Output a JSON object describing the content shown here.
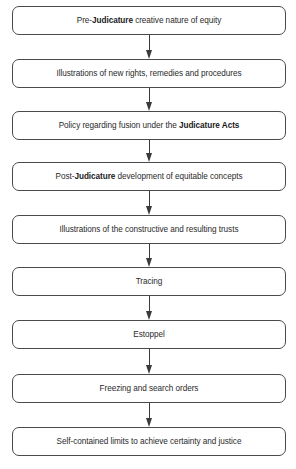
{
  "diagram": {
    "type": "vertical-flowchart",
    "colors": {
      "background": "#ffffff",
      "border": "#4a4a4a",
      "text": "#2a2a2a",
      "arrow": "#3a3a3a"
    },
    "nodes": [
      {
        "id": "n1",
        "top": 6,
        "pre": "Pre-",
        "bold": "Judicature",
        "post": " creative nature of equity"
      },
      {
        "id": "n2",
        "top": 59,
        "pre": "Illustrations of new rights, remedies and procedures",
        "bold": "",
        "post": ""
      },
      {
        "id": "n3",
        "top": 111,
        "pre": "Policy regarding fusion under the ",
        "bold": "Judicature Acts",
        "post": ""
      },
      {
        "id": "n4",
        "top": 162,
        "pre": "Post-",
        "bold": "Judicature",
        "post": " development of equitable concepts"
      },
      {
        "id": "n5",
        "top": 215,
        "pre": "Illustrations of the constructive and resulting  trusts",
        "bold": "",
        "post": ""
      },
      {
        "id": "n6",
        "top": 267,
        "pre": "Tracing",
        "bold": "",
        "post": ""
      },
      {
        "id": "n7",
        "top": 320,
        "pre": "Estoppel",
        "bold": "",
        "post": ""
      },
      {
        "id": "n8",
        "top": 374,
        "pre": "Freezing and search orders",
        "bold": "",
        "post": ""
      },
      {
        "id": "n9",
        "top": 427,
        "pre": "Self-contained limits to achieve certainty and justice",
        "bold": "",
        "post": ""
      }
    ],
    "edges": [
      {
        "from": "n1",
        "to": "n2"
      },
      {
        "from": "n2",
        "to": "n3"
      },
      {
        "from": "n3",
        "to": "n4"
      },
      {
        "from": "n4",
        "to": "n5"
      },
      {
        "from": "n5",
        "to": "n6"
      },
      {
        "from": "n6",
        "to": "n7"
      },
      {
        "from": "n7",
        "to": "n8"
      },
      {
        "from": "n8",
        "to": "n9"
      }
    ]
  }
}
